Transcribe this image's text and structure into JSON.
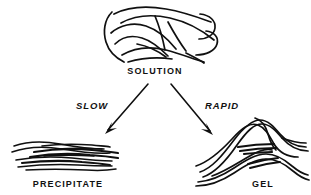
{
  "figure": {
    "background_color": "#ffffff",
    "ink_color": "#101010",
    "width": 311,
    "height": 195
  },
  "nodes": {
    "solution": {
      "label": "SOLUTION",
      "label_x": 155,
      "label_y": 74,
      "description": "entangled random-coil polymer chains"
    },
    "precipitate": {
      "label": "PRECIPITATE",
      "label_x": 68,
      "label_y": 187,
      "description": "closely packed parallel aligned fibrils"
    },
    "gel": {
      "label": "GEL",
      "label_x": 263,
      "label_y": 187,
      "description": "open network of arched strands with junction zones"
    }
  },
  "transitions": [
    {
      "name": "slow",
      "label": "SLOW",
      "label_x": 92,
      "label_y": 109,
      "from": "solution",
      "to": "precipitate",
      "x1": 148,
      "y1": 84,
      "x2": 107,
      "y2": 132
    },
    {
      "name": "rapid",
      "label": "RAPID",
      "label_x": 222,
      "label_y": 109,
      "from": "solution",
      "to": "gel",
      "x1": 171,
      "y1": 84,
      "x2": 212,
      "y2": 133
    }
  ]
}
